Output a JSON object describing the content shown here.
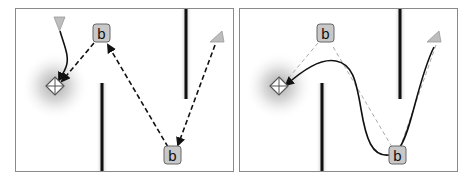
{
  "figure": {
    "panels": [
      {
        "id": "left",
        "description": "Path via beacons (dashed segments)",
        "beacons": [
          {
            "label": "b",
            "x": 85,
            "y": 24
          },
          {
            "label": "b",
            "x": 157,
            "y": 146
          }
        ],
        "start_marker": {
          "shape": "triangle",
          "x": 202,
          "y": 26
        },
        "agent_marker": {
          "shape": "triangle-down",
          "x": 43,
          "y": 14
        },
        "goal": {
          "shape": "diamond-crosshair",
          "x": 39,
          "y": 77
        },
        "walls": [
          {
            "x": 170,
            "y1": 0,
            "y2": 90
          },
          {
            "x": 86,
            "y1": 74,
            "y2": 164
          }
        ]
      },
      {
        "id": "right",
        "description": "Smoothed path (solid curve) over beacon route (light dashed)",
        "beacons": [
          {
            "label": "b",
            "x": 85,
            "y": 24
          },
          {
            "label": "b",
            "x": 157,
            "y": 146
          }
        ],
        "start_marker": {
          "shape": "triangle",
          "x": 196,
          "y": 26
        },
        "goal": {
          "shape": "diamond-crosshair",
          "x": 39,
          "y": 77
        },
        "walls": [
          {
            "x": 160,
            "y1": 0,
            "y2": 90
          },
          {
            "x": 82,
            "y1": 74,
            "y2": 164
          }
        ]
      }
    ],
    "beacon_label": "b",
    "colors": {
      "wall": "#111111",
      "beacon_fill": "#c8c8c8",
      "beacon_stroke": "#666666",
      "marker_fill": "#bdbdbd",
      "dash_dark": "#111111",
      "dash_light": "#aaaaaa",
      "border": "#8a8a8a"
    }
  }
}
